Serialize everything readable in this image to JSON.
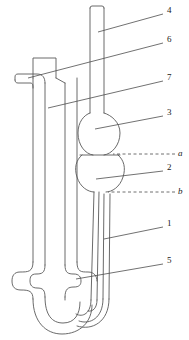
{
  "figure": {
    "kind": "technical-line-drawing",
    "background_color": "#ffffff",
    "line_color": "#595959",
    "leader_line_color": "#4d4d4d",
    "label_color": "#1a1a1a"
  },
  "callouts": [
    {
      "id": "callout-4",
      "label": "4",
      "label_x": 167,
      "label_y": 11,
      "style": "plain",
      "leader": {
        "x1": 163,
        "y1": 14,
        "x2": 98,
        "y2": 32
      },
      "points_to": "upper-vent-tube"
    },
    {
      "id": "callout-6",
      "label": "6",
      "label_x": 167,
      "label_y": 40,
      "style": "plain",
      "leader": {
        "x1": 163,
        "y1": 43,
        "x2": 28,
        "y2": 78
      },
      "points_to": "left-side-arm"
    },
    {
      "id": "callout-7",
      "label": "7",
      "label_x": 167,
      "label_y": 78,
      "style": "plain",
      "leader": {
        "x1": 163,
        "y1": 81,
        "x2": 48,
        "y2": 108
      },
      "points_to": "outer-jacket-tube"
    },
    {
      "id": "callout-3",
      "label": "3",
      "label_x": 167,
      "label_y": 113,
      "style": "plain",
      "leader": {
        "x1": 163,
        "y1": 116,
        "x2": 95,
        "y2": 129
      },
      "points_to": "upper-bulb"
    },
    {
      "id": "callout-a",
      "label": "a",
      "label_x": 178,
      "label_y": 150,
      "style": "italic-dashed",
      "leader": {
        "x1": 175,
        "y1": 154,
        "x2": 113,
        "y2": 154
      },
      "points_to": "upper-timing-mark"
    },
    {
      "id": "callout-2",
      "label": "2",
      "label_x": 167,
      "label_y": 168,
      "style": "plain",
      "leader": {
        "x1": 163,
        "y1": 171,
        "x2": 96,
        "y2": 179
      },
      "points_to": "lower-bulb"
    },
    {
      "id": "callout-b",
      "label": "b",
      "label_x": 178,
      "label_y": 188,
      "style": "italic-dashed",
      "leader": {
        "x1": 175,
        "y1": 192,
        "x2": 108,
        "y2": 192
      },
      "points_to": "lower-timing-mark"
    },
    {
      "id": "callout-1",
      "label": "1",
      "label_x": 167,
      "label_y": 224,
      "style": "plain",
      "leader": {
        "x1": 163,
        "y1": 227,
        "x2": 104,
        "y2": 239
      },
      "points_to": "capillary-tube"
    },
    {
      "id": "callout-5",
      "label": "5",
      "label_x": 167,
      "label_y": 261,
      "style": "plain",
      "leader": {
        "x1": 163,
        "y1": 264,
        "x2": 76,
        "y2": 279
      },
      "points_to": "reservoir-bulb"
    }
  ]
}
